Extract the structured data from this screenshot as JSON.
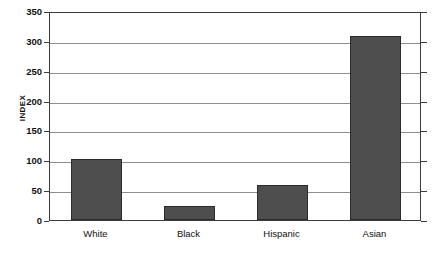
{
  "chart_data": {
    "type": "bar",
    "title": "",
    "subtitle": "",
    "xlabel": "",
    "ylabel": "INDEX",
    "categories": [
      "White",
      "Black",
      "Hispanic",
      "Asian"
    ],
    "values": [
      102,
      24,
      58,
      308
    ],
    "series": [
      {
        "name": "INDEX",
        "values": [
          102,
          24,
          58,
          308
        ]
      }
    ],
    "ylim": [
      0,
      350
    ],
    "ytick_labels": [
      "350",
      "300",
      "250",
      "200",
      "150",
      "100",
      "50",
      "0"
    ],
    "ytick_values": [
      350,
      300,
      250,
      200,
      150,
      100,
      50,
      0
    ],
    "ytick_step": 50,
    "grid": true,
    "grid_axis": "y",
    "legend": false,
    "legend_position": "none",
    "annotations": [],
    "colors": {
      "bar_fill": "#4e4e4e",
      "bar_border": "#2b2b2b",
      "gridline": "#8e8e8e",
      "frame": "#3c3c3c",
      "plot_background": "#ffffff",
      "text": "#111111"
    }
  }
}
